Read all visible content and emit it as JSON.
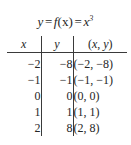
{
  "figure": {
    "title": {
      "lhs": "y",
      "eq1": "=",
      "fn": "f",
      "fn_arg": "(x)",
      "eq2": "=",
      "rhs_base": "x",
      "rhs_exp": "3",
      "full_text": "y = f(x) = x³"
    },
    "table": {
      "headers": {
        "x": "x",
        "y": "y",
        "pair_open": "(",
        "pair_x": "x",
        "pair_comma": ", ",
        "pair_y": "y",
        "pair_close": ")"
      },
      "rows": [
        {
          "x": "−2",
          "y": "−8",
          "pair": "(−2, −8)"
        },
        {
          "x": "−1",
          "y": "−1",
          "pair": "(−1, −1)"
        },
        {
          "x": "0",
          "y": "0",
          "pair": "(0, 0)"
        },
        {
          "x": "1",
          "y": "1",
          "pair": "(1, 1)"
        },
        {
          "x": "2",
          "y": "8",
          "pair": "(2, 8)"
        }
      ]
    },
    "colors": {
      "text": "#262626",
      "rule": "#3a3a3a",
      "background": "#ffffff"
    }
  },
  "chart_data": {
    "type": "table",
    "columns": [
      "x",
      "y",
      "(x, y)"
    ],
    "x": [
      -2,
      -1,
      0,
      1,
      2
    ],
    "values": [
      -8,
      -1,
      0,
      1,
      8
    ],
    "points": [
      [
        -2,
        -8
      ],
      [
        -1,
        -1
      ],
      [
        0,
        0
      ],
      [
        1,
        1
      ],
      [
        2,
        8
      ]
    ],
    "xlabel": "x",
    "ylabel": "y",
    "function": "x^3"
  }
}
